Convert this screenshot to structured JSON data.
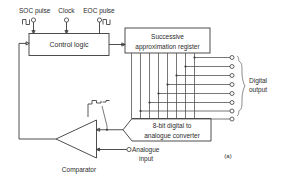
{
  "figure": {
    "caption": "(a)"
  },
  "inputs": {
    "soc": {
      "label": "SOC pulse",
      "icon": "pulse-waveform-icon",
      "terminal": "circle-terminal"
    },
    "clock": {
      "label": "Clock",
      "icon": "clock-terminal-icon",
      "terminal": "circle-terminal"
    },
    "eoc": {
      "label": "EOC pulse",
      "icon": "pulse-waveform-icon",
      "terminal": "circle-terminal"
    },
    "analogue": {
      "label_line1": "Analogue",
      "label_line2": "input",
      "terminal": "circle-terminal"
    }
  },
  "blocks": {
    "control_logic": {
      "label": "Control logic"
    },
    "sar": {
      "label_line1": "Successive",
      "label_line2": "approximation register"
    },
    "dac": {
      "label_line1": "8-bit digital to",
      "label_line2": "analogue converter"
    },
    "comparator": {
      "label": "Comparator"
    }
  },
  "output": {
    "label_line1": "Digital",
    "label_line2": "output",
    "bit_count": 8,
    "terminals": [
      "bit-7",
      "bit-6",
      "bit-5",
      "bit-4",
      "bit-3",
      "bit-2",
      "bit-1",
      "bit-0"
    ]
  },
  "annotations": {
    "staircase_waveform": "staircase-waveform-icon"
  },
  "colors": {
    "line": "#3a3a3a",
    "text": "#2b2b2b",
    "background": "#ffffff",
    "brace": "#6a6a6a"
  }
}
